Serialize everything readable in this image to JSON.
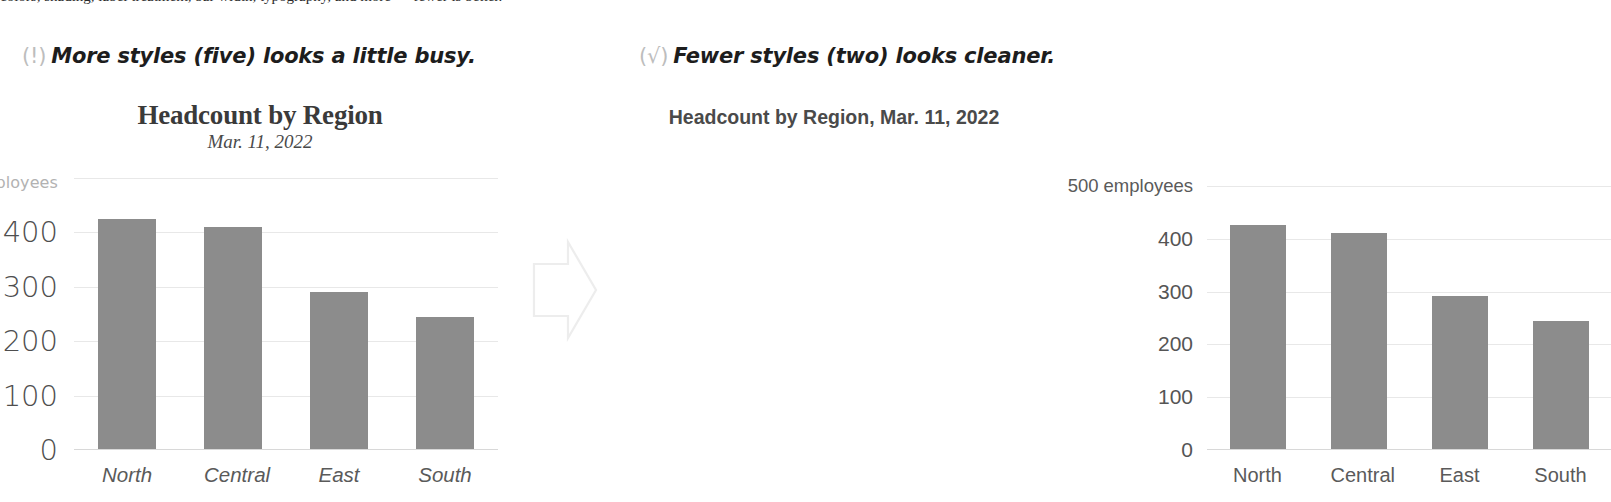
{
  "top_cutoff_text": "colors, shading, label treatment, bar width, typography, and more — fewer is better.",
  "panels": [
    {
      "id": "before",
      "caption": {
        "marker": "(!)",
        "marker_name": "warning-marker-icon",
        "text": "More styles (five) looks a little busy."
      },
      "title": "Headcount by Region",
      "subtitle": "Mar. 11, 2022",
      "unit_number": "500",
      "unit_label": "employees",
      "yticks": [
        "400",
        "300",
        "200",
        "100",
        "0"
      ]
    },
    {
      "id": "after",
      "caption": {
        "marker": "(√)",
        "marker_name": "check-marker-icon",
        "text": "Fewer styles (two) looks cleaner."
      },
      "title": "Headcount by Region, Mar. 11, 2022",
      "subtitle": "",
      "unit_number": "500",
      "unit_label": "employees",
      "yticks": [
        "400",
        "300",
        "200",
        "100",
        "0"
      ]
    }
  ],
  "arrow": {
    "label": "transition-arrow",
    "color": "#ededed"
  },
  "colors": {
    "bar": "#8c8c8c",
    "gridline": "#e8e8e8",
    "axis": "#d8d8d8",
    "title_before": "#3a3a3a",
    "title_after": "#4a4a4a",
    "unit_muted": "#b2b2b2",
    "caption_text": "#1d1d1d",
    "caption_marker": "#bdbdbd"
  },
  "chart_data": [
    {
      "type": "bar",
      "title": "Headcount by Region",
      "subtitle": "Mar. 11, 2022",
      "xlabel": "",
      "ylabel": "employees",
      "categories": [
        "North",
        "Central",
        "East",
        "South"
      ],
      "values": [
        425,
        410,
        290,
        243
      ],
      "ylim": [
        0,
        500
      ],
      "yticks": [
        0,
        100,
        200,
        300,
        400,
        500
      ],
      "grid": true,
      "legend": "none",
      "style_notes": "five type styles: serif bold title, serif italic subtitle, light large y-ticks, small gray unit label, sans italic x-ticks"
    },
    {
      "type": "bar",
      "title": "Headcount by Region, Mar. 11, 2022",
      "subtitle": "",
      "xlabel": "",
      "ylabel": "employees",
      "categories": [
        "North",
        "Central",
        "East",
        "South"
      ],
      "values": [
        425,
        410,
        290,
        243
      ],
      "ylim": [
        0,
        500
      ],
      "yticks": [
        0,
        100,
        200,
        300,
        400,
        500
      ],
      "grid": true,
      "legend": "none",
      "style_notes": "two type styles: sans bold title, sans regular labels throughout"
    }
  ]
}
